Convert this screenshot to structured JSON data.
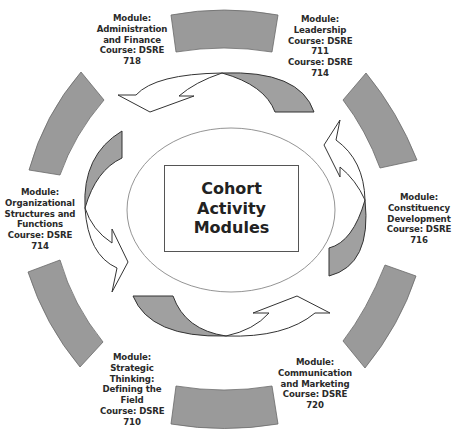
{
  "title": {
    "lines": [
      "Cohort",
      "Activity",
      "Modules"
    ]
  },
  "modules": [
    {
      "id": "administration-finance",
      "lines": [
        "Module:",
        "Administration",
        "and Finance",
        "Course: DSRE",
        "718"
      ]
    },
    {
      "id": "leadership",
      "lines": [
        "Module:",
        "Leadership",
        "Course: DSRE",
        "711",
        "Course: DSRE",
        "714"
      ]
    },
    {
      "id": "organizational-structures",
      "lines": [
        "Module:",
        "Organizational",
        "Structures and",
        "Functions",
        "Course: DSRE",
        "714"
      ]
    },
    {
      "id": "constituency-development",
      "lines": [
        "Module:",
        "Constituency",
        "Development",
        "Course: DSRE",
        "716"
      ]
    },
    {
      "id": "strategic-thinking",
      "lines": [
        "Module:",
        "Strategic",
        "Thinking:",
        "Defining the",
        "Field",
        "Course: DSRE",
        "710"
      ]
    },
    {
      "id": "communication-marketing",
      "lines": [
        "Module:",
        "Communication",
        "and Marketing",
        "Course: DSRE",
        "720"
      ]
    }
  ],
  "colors": {
    "segment_fill": "#9a9a9a",
    "segment_stroke": "#6a6a6a",
    "arrow_fill": "#ffffff",
    "arrow_shade": "#a0a0a0",
    "arrow_stroke": "#333333",
    "ellipse_stroke": "#888888",
    "text": "#2a2a2a"
  }
}
